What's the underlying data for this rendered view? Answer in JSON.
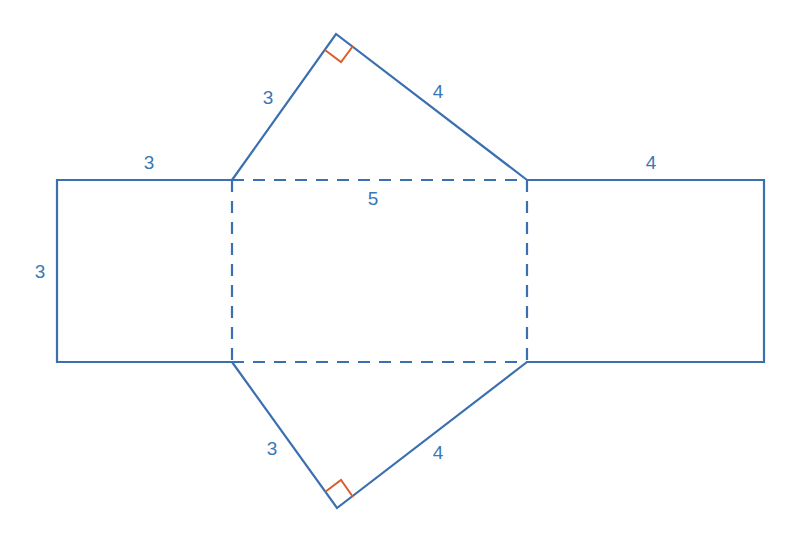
{
  "diagram": {
    "colors": {
      "line": "#3a6fb0",
      "right_angle": "#d9602a",
      "label": "#3a78b5"
    },
    "labels": {
      "left_rect_top": "3",
      "left_rect_side": "3",
      "top_tri_left": "3",
      "top_tri_right": "4",
      "middle_top": "5",
      "right_rect_top": "4",
      "bottom_tri_left": "3",
      "bottom_tri_right": "4"
    }
  }
}
